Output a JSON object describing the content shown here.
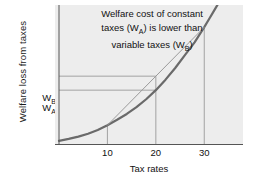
{
  "chart_data": {
    "type": "line",
    "title": "",
    "annotation": {
      "line1": "Welfare cost of constant",
      "line2_pre": "taxes (W",
      "line2_sub": "A",
      "line2_post": ") is lower than",
      "line3_pre": "variable taxes (W",
      "line3_sub": "B",
      "line3_post": ")"
    },
    "xlabel": "Tax rates",
    "ylabel": "Welfare loss from taxes",
    "xticks": [
      {
        "value": 10,
        "label": "10"
      },
      {
        "value": 20,
        "label": "20"
      },
      {
        "value": 30,
        "label": "30"
      }
    ],
    "yticks": [
      {
        "label_pre": "W",
        "label_sub": "B",
        "key": "WB",
        "value": 2.28
      },
      {
        "label_pre": "W",
        "label_sub": "A",
        "key": "WA",
        "value": 1.85
      }
    ],
    "xlim": [
      0,
      38
    ],
    "ylim": [
      0,
      6
    ],
    "grid": false,
    "legend": null,
    "series": [
      {
        "name": "welfare-loss-curve",
        "type": "curve",
        "color": "#6a6a6a",
        "width": 2.2,
        "x": [
          0,
          2,
          4,
          6,
          8,
          10,
          12,
          14,
          16,
          18,
          20,
          22,
          24,
          26,
          28,
          30,
          31,
          32,
          33,
          34,
          35
        ],
        "y": [
          0.18,
          0.26,
          0.36,
          0.48,
          0.64,
          0.85,
          1.08,
          1.33,
          1.62,
          1.96,
          2.35,
          2.8,
          3.3,
          3.85,
          4.4,
          5.05,
          5.4,
          5.75,
          6.1,
          6.5,
          6.9
        ]
      },
      {
        "name": "variable-tax-chord",
        "type": "chord",
        "color": "#9a9a9a",
        "width": 1.0,
        "x": [
          10,
          30
        ],
        "y": [
          0.85,
          5.05
        ]
      }
    ],
    "guides": [
      {
        "name": "wb-horizontal",
        "orient": "h",
        "value": 2.95,
        "from_x": 0,
        "to_x": 20
      },
      {
        "name": "wa-horizontal",
        "orient": "h",
        "value": 2.35,
        "from_x": 0,
        "to_x": 20
      },
      {
        "name": "x10-vertical",
        "orient": "v",
        "value": 10,
        "from_y": 0,
        "to_y": 0.85
      },
      {
        "name": "x20-vertical",
        "orient": "v",
        "value": 20,
        "from_y": 0,
        "to_y": 2.95
      },
      {
        "name": "x30-vertical",
        "orient": "v",
        "value": 30,
        "from_y": 0,
        "to_y": 5.05
      }
    ],
    "colors": {
      "plot_background": "#ededed",
      "figure_background": "#ffffff",
      "curve": "#6a6a6a",
      "chord": "#9a9a9a",
      "guide": "#9a9a9a",
      "axis": "#555555",
      "text": "#111111"
    }
  }
}
